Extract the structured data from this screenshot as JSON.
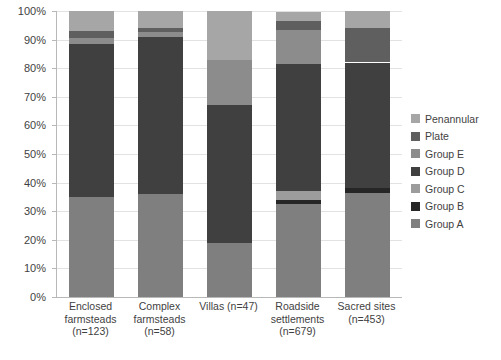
{
  "chart_data": {
    "type": "bar",
    "stacked": true,
    "normalized": "100%",
    "title": "",
    "subtitle": "",
    "xlabel": "",
    "ylabel": "",
    "ylim": [
      0,
      100
    ],
    "ytick_labels": [
      "0%",
      "10%",
      "20%",
      "30%",
      "40%",
      "50%",
      "60%",
      "70%",
      "80%",
      "90%",
      "100%"
    ],
    "ytick_values": [
      0,
      10,
      20,
      30,
      40,
      50,
      60,
      70,
      80,
      90,
      100
    ],
    "grid": "horizontal",
    "legend_position": "right",
    "categories": [
      "Enclosed farmsteads (n=123)",
      "Complex farmsteads (n=58)",
      "Villas (n=47)",
      "Roadside settlements (n=679)",
      "Sacred sites (n=453)"
    ],
    "category_lines": [
      [
        "Enclosed",
        "farmsteads",
        "(n=123)"
      ],
      [
        "Complex",
        "farmsteads",
        "(n=58)"
      ],
      [
        "Villas (n=47)"
      ],
      [
        "Roadside",
        "settlements",
        "(n=679)"
      ],
      [
        "Sacred sites",
        "(n=453)"
      ]
    ],
    "series": [
      {
        "name": "Group A",
        "color": "#7f7f7f",
        "values": [
          35.0,
          36.0,
          19.0,
          32.5,
          36.5
        ]
      },
      {
        "name": "Group B",
        "color": "#262626",
        "values": [
          0.0,
          0.0,
          0.0,
          1.5,
          1.5
        ]
      },
      {
        "name": "Group C",
        "color": "#9c9c9c",
        "values": [
          0.0,
          0.0,
          0.0,
          3.0,
          0.0
        ]
      },
      {
        "name": "Group D",
        "color": "#404040",
        "values": [
          53.5,
          55.0,
          48.0,
          44.5,
          44.0
        ]
      },
      {
        "name": "Group E",
        "color": "#8c8c8c",
        "values": [
          2.0,
          1.5,
          16.0,
          12.0,
          0.0
        ]
      },
      {
        "name": "Plate",
        "color": "#5f5f5f",
        "values": [
          2.5,
          1.5,
          0.0,
          3.0,
          12.0
        ]
      },
      {
        "name": "Penannular",
        "color": "#a6a6a6",
        "values": [
          7.0,
          6.0,
          17.0,
          3.0,
          6.0
        ]
      }
    ],
    "stack_order_bottom_to_top": [
      "Group A",
      "Group B",
      "Group C",
      "Group D",
      "Group E",
      "Plate",
      "Penannular"
    ]
  },
  "legend": {
    "items": [
      {
        "label": "Penannular",
        "color": "#a6a6a6"
      },
      {
        "label": "Plate",
        "color": "#5f5f5f"
      },
      {
        "label": "Group E",
        "color": "#8c8c8c"
      },
      {
        "label": "Group D",
        "color": "#404040"
      },
      {
        "label": "Group C",
        "color": "#9c9c9c"
      },
      {
        "label": "Group B",
        "color": "#262626"
      },
      {
        "label": "Group A",
        "color": "#7f7f7f"
      }
    ]
  },
  "colors": {
    "axis": "#b8b8b8",
    "grid": "#e2e2e2",
    "text": "#3f3f3f",
    "background": "#ffffff"
  }
}
